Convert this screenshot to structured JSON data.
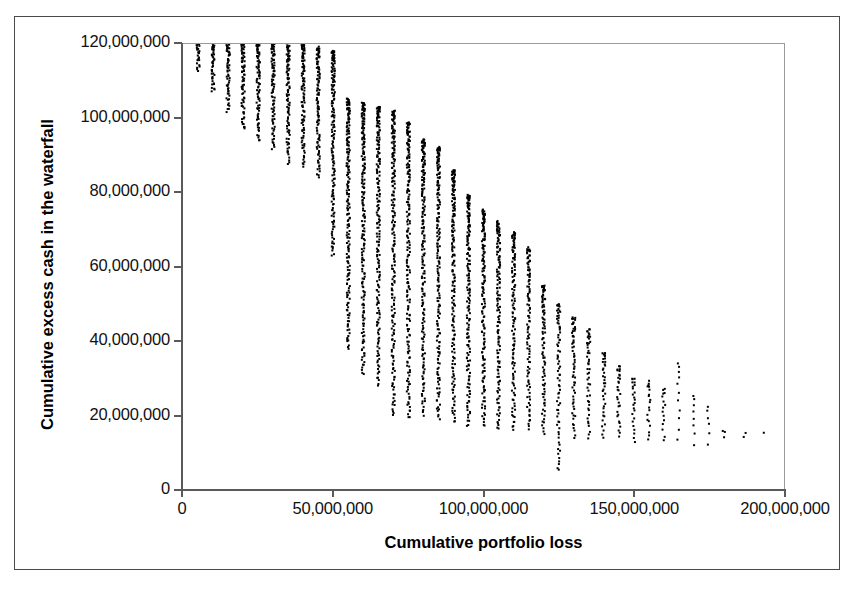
{
  "chart_data": {
    "type": "scatter",
    "title": "",
    "xlabel": "Cumulative portfolio loss",
    "ylabel": "Cumulative excess cash in the waterfall",
    "xlim": [
      0,
      200000000
    ],
    "ylim": [
      0,
      120000000
    ],
    "grid": false,
    "legend": null,
    "marker": {
      "shape": "square",
      "color": "#000000",
      "size_px": 2
    },
    "x_ticks": [
      0,
      50000000,
      100000000,
      150000000,
      200000000
    ],
    "x_tick_labels": [
      "0",
      "50,000,000",
      "100,000,000",
      "150,000,000",
      "200,000,000"
    ],
    "y_ticks": [
      0,
      20000000,
      40000000,
      60000000,
      80000000,
      100000000,
      120000000
    ],
    "y_tick_labels": [
      "0",
      "20,000,000",
      "40,000,000",
      "60,000,000",
      "80,000,000",
      "100,000,000",
      "120,000,000"
    ],
    "columns": [
      {
        "x": 5000000,
        "y_top": 120000000,
        "y_bottom": 113000000,
        "n": 26
      },
      {
        "x": 10000000,
        "y_top": 120000000,
        "y_bottom": 107000000,
        "n": 44
      },
      {
        "x": 15000000,
        "y_top": 120000000,
        "y_bottom": 102000000,
        "n": 60
      },
      {
        "x": 20000000,
        "y_top": 120000000,
        "y_bottom": 97000000,
        "n": 74
      },
      {
        "x": 25000000,
        "y_top": 120000000,
        "y_bottom": 94000000,
        "n": 84
      },
      {
        "x": 30000000,
        "y_top": 120000000,
        "y_bottom": 92000000,
        "n": 90
      },
      {
        "x": 35000000,
        "y_top": 120000000,
        "y_bottom": 88000000,
        "n": 100
      },
      {
        "x": 40000000,
        "y_top": 120000000,
        "y_bottom": 87000000,
        "n": 104
      },
      {
        "x": 45000000,
        "y_top": 119000000,
        "y_bottom": 84000000,
        "n": 110
      },
      {
        "x": 50000000,
        "y_top": 118000000,
        "y_bottom": 63000000,
        "n": 160
      },
      {
        "x": 55000000,
        "y_top": 105000000,
        "y_bottom": 38000000,
        "n": 190
      },
      {
        "x": 60000000,
        "y_top": 104000000,
        "y_bottom": 31000000,
        "n": 195
      },
      {
        "x": 65000000,
        "y_top": 103000000,
        "y_bottom": 28000000,
        "n": 195
      },
      {
        "x": 70000000,
        "y_top": 102000000,
        "y_bottom": 20000000,
        "n": 200
      },
      {
        "x": 75000000,
        "y_top": 99000000,
        "y_bottom": 19000000,
        "n": 195
      },
      {
        "x": 80000000,
        "y_top": 94000000,
        "y_bottom": 20000000,
        "n": 190
      },
      {
        "x": 85000000,
        "y_top": 92000000,
        "y_bottom": 19000000,
        "n": 185
      },
      {
        "x": 90000000,
        "y_top": 86000000,
        "y_bottom": 18000000,
        "n": 175
      },
      {
        "x": 95000000,
        "y_top": 79000000,
        "y_bottom": 17000000,
        "n": 165
      },
      {
        "x": 100000000,
        "y_top": 75000000,
        "y_bottom": 17000000,
        "n": 155
      },
      {
        "x": 105000000,
        "y_top": 72000000,
        "y_bottom": 16000000,
        "n": 140
      },
      {
        "x": 110000000,
        "y_top": 69000000,
        "y_bottom": 16000000,
        "n": 125
      },
      {
        "x": 115000000,
        "y_top": 65000000,
        "y_bottom": 16000000,
        "n": 105
      },
      {
        "x": 120000000,
        "y_top": 55000000,
        "y_bottom": 15000000,
        "n": 88
      },
      {
        "x": 125000000,
        "y_top": 50000000,
        "y_bottom": 5000000,
        "n": 74
      },
      {
        "x": 130000000,
        "y_top": 46000000,
        "y_bottom": 14000000,
        "n": 60
      },
      {
        "x": 135000000,
        "y_top": 43000000,
        "y_bottom": 14000000,
        "n": 48
      },
      {
        "x": 140000000,
        "y_top": 37000000,
        "y_bottom": 14000000,
        "n": 38
      },
      {
        "x": 145000000,
        "y_top": 33000000,
        "y_bottom": 14000000,
        "n": 30
      },
      {
        "x": 150000000,
        "y_top": 30000000,
        "y_bottom": 13000000,
        "n": 24
      },
      {
        "x": 155000000,
        "y_top": 29000000,
        "y_bottom": 13000000,
        "n": 19
      },
      {
        "x": 160000000,
        "y_top": 27000000,
        "y_bottom": 13000000,
        "n": 15
      },
      {
        "x": 165000000,
        "y_top": 34000000,
        "y_bottom": 13000000,
        "n": 11
      },
      {
        "x": 170000000,
        "y_top": 25000000,
        "y_bottom": 12000000,
        "n": 8
      },
      {
        "x": 175000000,
        "y_top": 22000000,
        "y_bottom": 12000000,
        "n": 6
      },
      {
        "x": 180000000,
        "y_top": 16000000,
        "y_bottom": 14000000,
        "n": 3
      },
      {
        "x": 187000000,
        "y_top": 15000000,
        "y_bottom": 14000000,
        "n": 2
      },
      {
        "x": 193000000,
        "y_top": 15000000,
        "y_bottom": 15000000,
        "n": 1
      }
    ]
  },
  "axes": {
    "x_title": "Cumulative portfolio loss",
    "y_title": "Cumulative excess cash in the waterfall"
  }
}
